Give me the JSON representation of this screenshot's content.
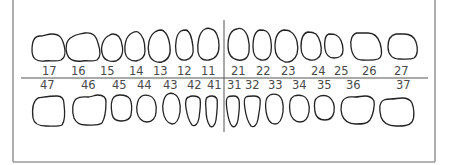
{
  "chart": {
    "notation": "FDI",
    "upper_right": [
      "17",
      "16",
      "15",
      "14",
      "13",
      "12",
      "11"
    ],
    "upper_left": [
      "21",
      "22",
      "23",
      "24",
      "25",
      "26",
      "27"
    ],
    "lower_right": [
      "47",
      "46",
      "45",
      "44",
      "43",
      "42",
      "41"
    ],
    "lower_left": [
      "31",
      "32",
      "33",
      "34",
      "35",
      "36",
      "37"
    ]
  },
  "labels": {
    "t17": "17",
    "t16": "16",
    "t15": "15",
    "t14": "14",
    "t13": "13",
    "t12": "12",
    "t11": "11",
    "t21": "21",
    "t22": "22",
    "t23": "23",
    "t24": "24",
    "t25": "25",
    "t26": "26",
    "t27": "27",
    "t47": "47",
    "t46": "46",
    "t45": "45",
    "t44": "44",
    "t43": "43",
    "t42": "42",
    "t41": "41",
    "t31": "31",
    "t32": "32",
    "t33": "33",
    "t34": "34",
    "t35": "35",
    "t36": "36",
    "t37": "37"
  },
  "colors": {
    "outline": "#222222",
    "label": "#4a4a4a",
    "border": "#9a9a9a",
    "background": "#ffffff"
  }
}
